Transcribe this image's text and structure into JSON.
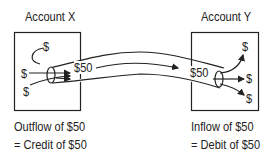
{
  "account_x": {
    "title": "Account X",
    "dollar_symbols": [
      "$",
      "$",
      "$"
    ],
    "flow_amount": "$50",
    "caption_line1": "Outflow of $50",
    "caption_line2": "= Credit of $50"
  },
  "account_y": {
    "title": "Account Y",
    "dollar_symbols": [
      "$",
      "$",
      "$"
    ],
    "flow_amount": "$50",
    "caption_line1": "Inflow of $50",
    "caption_line2": "= Debit of $50"
  },
  "colors": {
    "stroke": "#222222",
    "background": "#ffffff"
  }
}
